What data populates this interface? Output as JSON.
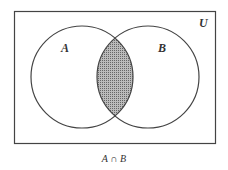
{
  "diagram": {
    "type": "venn",
    "universe_label": "U",
    "sets": [
      {
        "label": "A"
      },
      {
        "label": "B"
      }
    ],
    "shaded_region": "A ∩ B",
    "caption": "A ∩ B",
    "colors": {
      "stroke": "#444444",
      "shade": "#999999",
      "background": "#ffffff"
    }
  }
}
